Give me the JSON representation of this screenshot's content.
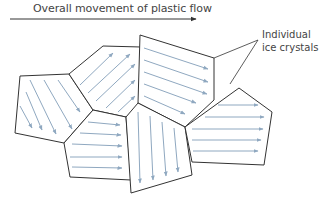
{
  "title": "Overall movement of plastic flow",
  "label": {
    "line1": "Individual",
    "line2": "ice crystals"
  },
  "colors": {
    "outline": "#333333",
    "flow_arrow": "#8fa8c0",
    "text": "#444444"
  }
}
